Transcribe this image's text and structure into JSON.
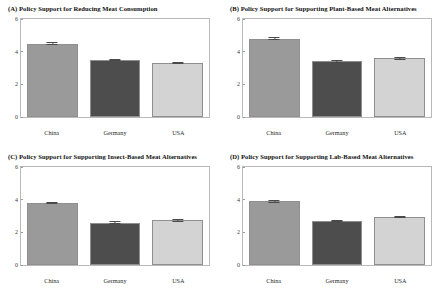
{
  "chart_data": [
    {
      "type": "bar",
      "panel": "A",
      "title": "(A) Policy Support for Reducing Meat Consumption",
      "categories": [
        "China",
        "Germany",
        "USA"
      ],
      "values": [
        4.5,
        3.5,
        3.3
      ],
      "errors": [
        0.07,
        0.07,
        0.07
      ],
      "xlabel": "",
      "ylabel": "",
      "ylim": [
        0,
        6
      ],
      "yticks": [
        0,
        2,
        4,
        6
      ],
      "grid": false,
      "legend": "none",
      "colors": [
        "#9a9a9a",
        "#4d4d4d",
        "#d3d3d3"
      ]
    },
    {
      "type": "bar",
      "panel": "B",
      "title": "(B) Policy Support for Supporting Plant-Based Meat Alternatives",
      "categories": [
        "China",
        "Germany",
        "USA"
      ],
      "values": [
        4.8,
        3.4,
        3.6
      ],
      "errors": [
        0.07,
        0.07,
        0.07
      ],
      "xlabel": "",
      "ylabel": "",
      "ylim": [
        0,
        6
      ],
      "yticks": [
        0,
        2,
        4,
        6
      ],
      "grid": false,
      "legend": "none",
      "colors": [
        "#9a9a9a",
        "#4d4d4d",
        "#d3d3d3"
      ]
    },
    {
      "type": "bar",
      "panel": "C",
      "title": "(C) Policy Support for Supporting Insect-Based Meat Alternatives",
      "categories": [
        "China",
        "Germany",
        "USA"
      ],
      "values": [
        3.8,
        2.6,
        2.75
      ],
      "errors": [
        0.08,
        0.07,
        0.08
      ],
      "xlabel": "",
      "ylabel": "",
      "ylim": [
        0,
        6
      ],
      "yticks": [
        0,
        2,
        4,
        6
      ],
      "grid": false,
      "legend": "none",
      "colors": [
        "#9a9a9a",
        "#4d4d4d",
        "#d3d3d3"
      ]
    },
    {
      "type": "bar",
      "panel": "D",
      "title": "(D) Policy Support for Supporting Lab-Based Meat Alternatives",
      "categories": [
        "China",
        "Germany",
        "USA"
      ],
      "values": [
        3.9,
        2.7,
        2.95
      ],
      "errors": [
        0.08,
        0.07,
        0.08
      ],
      "xlabel": "",
      "ylabel": "",
      "ylim": [
        0,
        6
      ],
      "yticks": [
        0,
        2,
        4,
        6
      ],
      "grid": false,
      "legend": "none",
      "colors": [
        "#9a9a9a",
        "#4d4d4d",
        "#d3d3d3"
      ]
    }
  ],
  "panels": {
    "a": {
      "title": "(A) Policy Support for Reducing Meat Consumption",
      "yticks": [
        "6",
        "4",
        "2",
        "0"
      ],
      "xlabels": [
        "China",
        "Germany",
        "USA"
      ]
    },
    "b": {
      "title": "(B) Policy Support for Supporting Plant-Based Meat Alternatives",
      "yticks": [
        "6",
        "4",
        "2",
        "0"
      ],
      "xlabels": [
        "China",
        "Germany",
        "USA"
      ]
    },
    "c": {
      "title": "(C) Policy Support for Supporting Insect-Based Meat Alternatives",
      "yticks": [
        "6",
        "4",
        "2",
        "0"
      ],
      "xlabels": [
        "China",
        "Germany",
        "USA"
      ]
    },
    "d": {
      "title": "(D) Policy Support for Supporting Lab-Based Meat Alternatives",
      "yticks": [
        "6",
        "4",
        "2",
        "0"
      ],
      "xlabels": [
        "China",
        "Germany",
        "USA"
      ]
    }
  }
}
